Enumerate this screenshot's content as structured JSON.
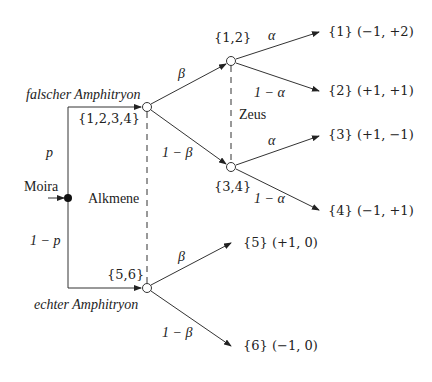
{
  "diagram": {
    "type": "game-tree",
    "root": {
      "label": "Moira"
    },
    "info_sets": [
      {
        "label": "Alkmene",
        "nodes": [
          "{1,2,3,4}",
          "{5,6}"
        ]
      },
      {
        "label": "Zeus",
        "nodes": [
          "{1,2}",
          "{3,4}"
        ]
      }
    ],
    "branches": {
      "root_up_prob": "p",
      "root_down_prob": "1 − p",
      "up_label": "falscher Amphitryon",
      "down_label": "echter Amphitryon",
      "beta": "β",
      "one_minus_beta": "1 − β",
      "alpha": "α",
      "one_minus_alpha": "1 − α"
    },
    "nodes": {
      "upper": "{1,2,3,4}",
      "lower": "{5,6}",
      "zeus_top": "{1,2}",
      "zeus_bottom": "{3,4}"
    },
    "outcomes": [
      {
        "set": "{1}",
        "payoff": "(−1, +2)"
      },
      {
        "set": "{2}",
        "payoff": "(+1, +1)"
      },
      {
        "set": "{3}",
        "payoff": "(+1, −1)"
      },
      {
        "set": "{4}",
        "payoff": "(−1, +1)"
      },
      {
        "set": "{5}",
        "payoff": "(+1,  0)"
      },
      {
        "set": "{6}",
        "payoff": "(−1,  0)"
      }
    ]
  }
}
